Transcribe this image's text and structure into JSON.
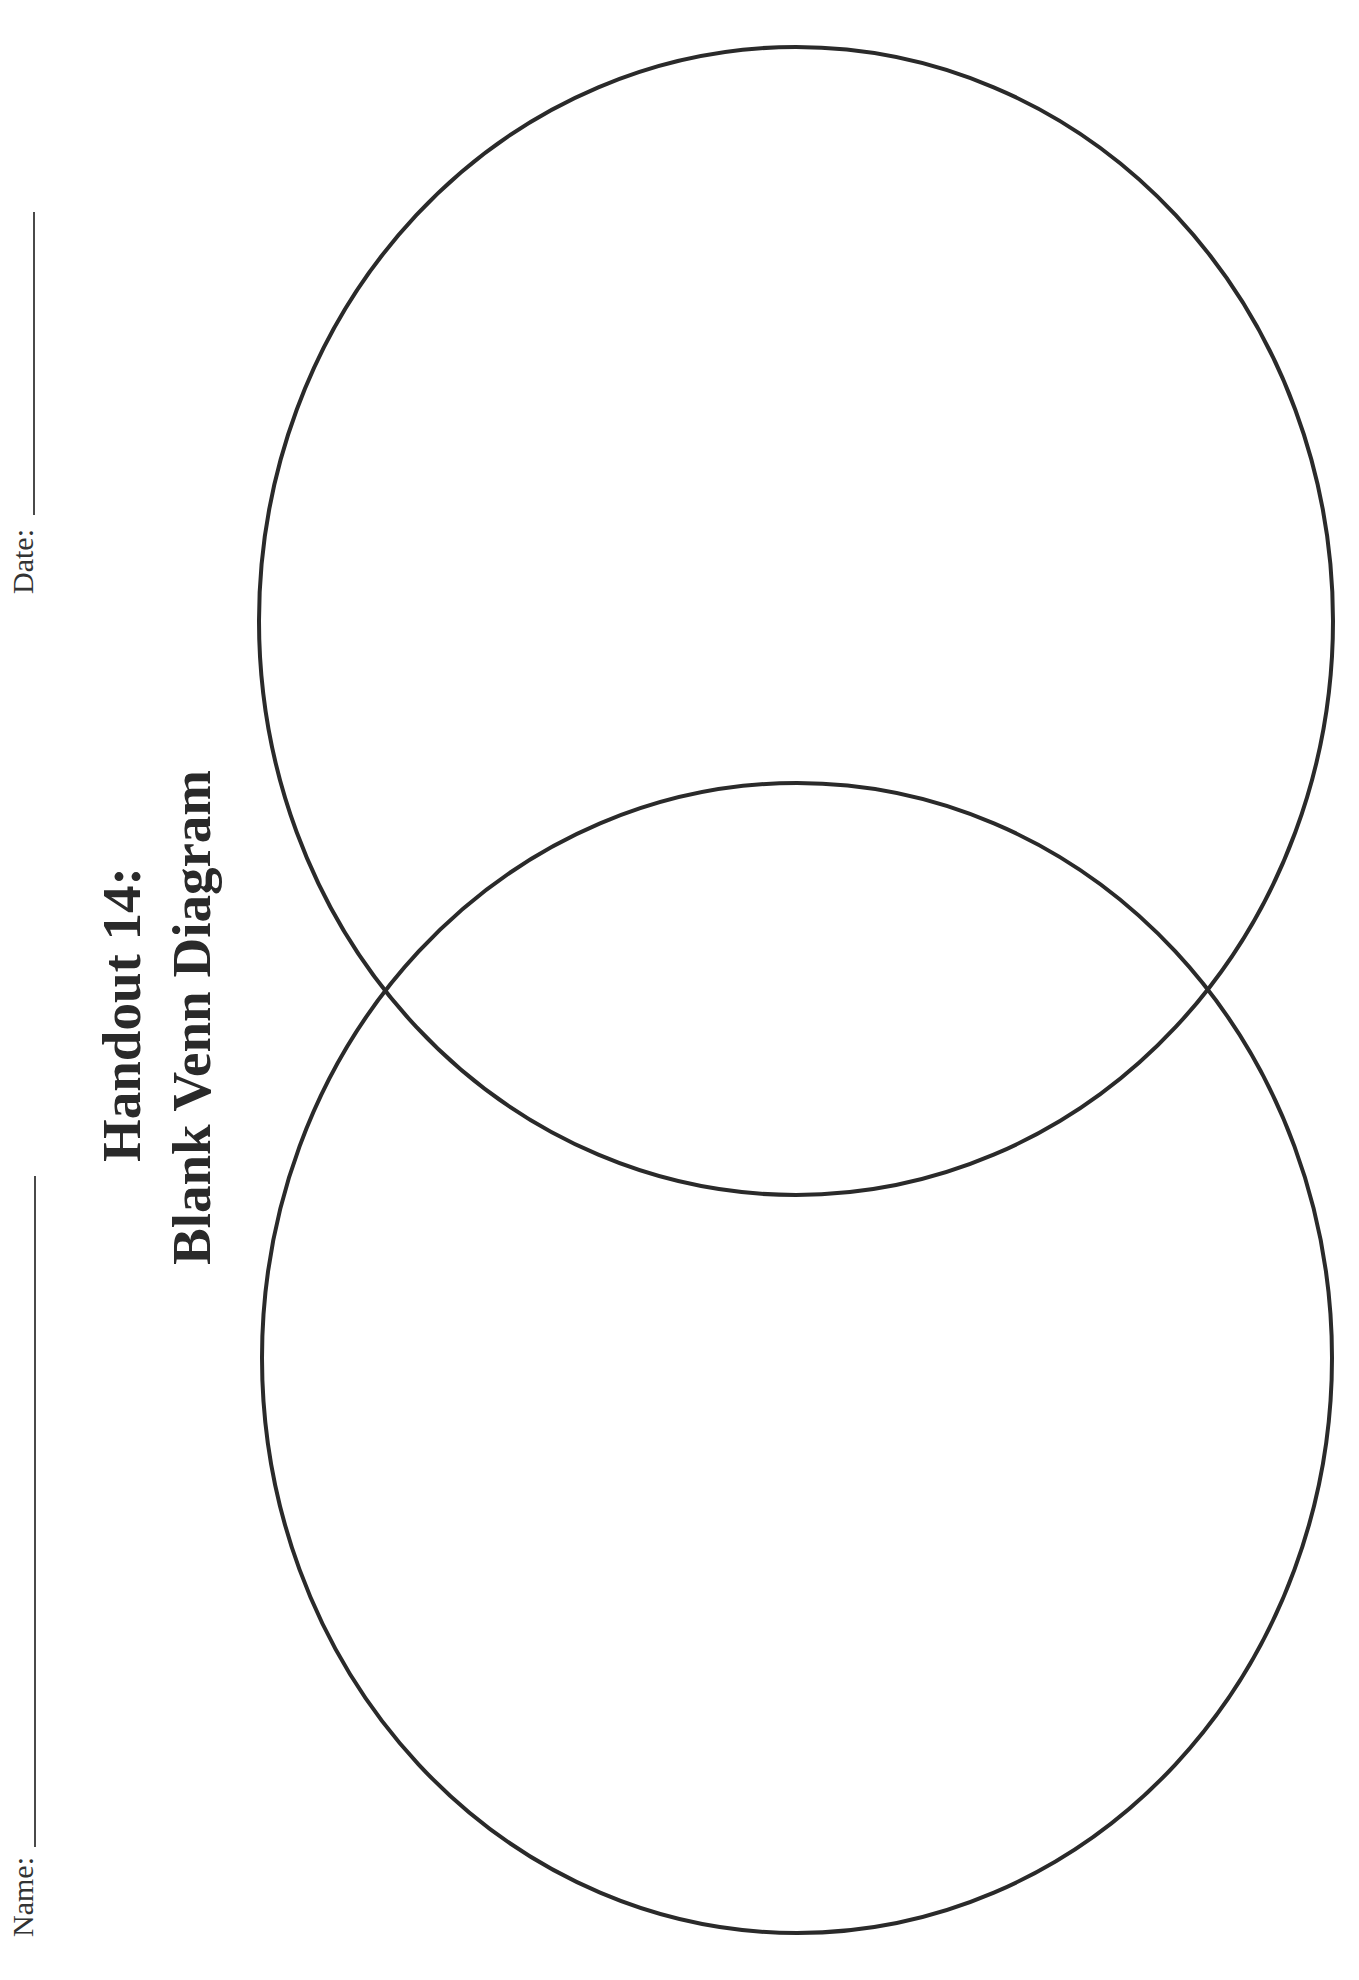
{
  "handout": {
    "title_line1": "Handout 14:",
    "title_line2": "Blank Venn Diagram"
  },
  "fields": {
    "name_label": "Name:",
    "date_label": "Date:"
  },
  "diagram": {
    "type": "venn",
    "set_count": 2,
    "orientation": "vertical",
    "stroke_color": "#2a2a2a",
    "background": "#ffffff",
    "circles": [
      {
        "id": "top",
        "cx": 796,
        "cy": 621,
        "rx": 537,
        "ry": 574
      },
      {
        "id": "bottom",
        "cx": 797,
        "cy": 1358,
        "rx": 535,
        "ry": 575
      }
    ]
  }
}
